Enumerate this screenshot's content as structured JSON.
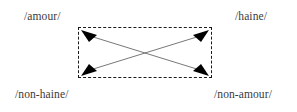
{
  "diagram": {
    "type": "semiotic-square",
    "title": "",
    "canvas": {
      "width": 297,
      "height": 112,
      "background": "#ffffff"
    },
    "box": {
      "x": 78,
      "y": 27,
      "width": 134,
      "height": 51,
      "border_style": "dashed",
      "border_color": "#1a1a1a"
    },
    "labels": {
      "top_left": "/amour/",
      "top_right": "/haine/",
      "bottom_left": "/non-haine/",
      "bottom_right": "/non-amour/"
    },
    "text_color": "#3a3a3a",
    "arrows": [
      {
        "name": "arrow-topleft-to-bottomright",
        "from": "top-left-corner",
        "to": "bottom-right-corner",
        "head": "both",
        "color": "#555555"
      },
      {
        "name": "arrow-bottomleft-to-topright",
        "from": "bottom-left-corner",
        "to": "top-right-corner",
        "head": "both",
        "color": "#555555"
      }
    ],
    "crossing_point": {
      "x": 145,
      "y": 53
    }
  }
}
